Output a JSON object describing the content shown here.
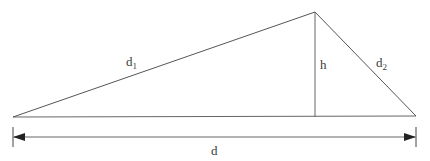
{
  "diagram": {
    "type": "triangle-height-dimension",
    "labels": {
      "side_left": "d",
      "side_left_sub": "1",
      "side_right": "d",
      "side_right_sub": "2",
      "height": "h",
      "base": "d"
    },
    "vertices": {
      "left": [
        13,
        117
      ],
      "top": [
        315,
        12
      ],
      "right": [
        416,
        116
      ],
      "height_foot": [
        315,
        117
      ]
    },
    "dimension_line": {
      "y": 137,
      "x_start": 13,
      "x_end": 416,
      "arrows": "both"
    },
    "colors": {
      "stroke": "#555555",
      "text": "#3a3a3a",
      "background": "#ffffff"
    }
  }
}
